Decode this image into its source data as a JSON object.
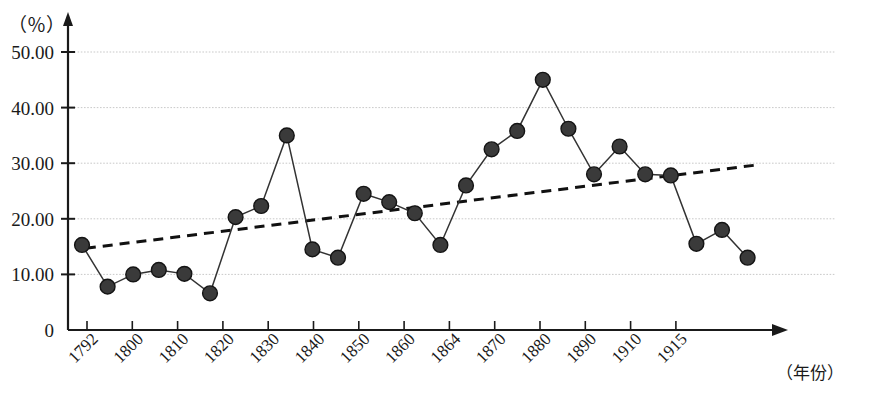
{
  "chart_data": {
    "type": "line",
    "title": "",
    "subtitle": "",
    "xlabel": "（年份）",
    "ylabel": "（％）",
    "y_unit_label": "（％）",
    "ylim": [
      0,
      55
    ],
    "xlim_index": [
      0,
      27
    ],
    "grid": true,
    "grid_style": "dotted-horizontal",
    "legend": "none",
    "y_ticks": [
      "0",
      "10.00",
      "20.00",
      "30.00",
      "40.00",
      "50.00"
    ],
    "y_tick_values": [
      0,
      10,
      20,
      30,
      40,
      50
    ],
    "x_tick_labels": [
      "1792",
      "1800",
      "1810",
      "1820",
      "1830",
      "1840",
      "1850",
      "1860",
      "1864",
      "1870",
      "1880",
      "1890",
      "1910",
      "1915"
    ],
    "x_tick_indices": [
      0,
      2,
      4,
      6,
      8,
      10,
      12,
      14,
      16,
      18,
      20,
      22,
      24,
      26
    ],
    "series": [
      {
        "name": "value",
        "style": "line-with-round-markers",
        "color": "#333333",
        "x_index": [
          0,
          1,
          2,
          3,
          4,
          5,
          6,
          7,
          8,
          9,
          10,
          11,
          12,
          13,
          14,
          15,
          16,
          17,
          18,
          19,
          20,
          21,
          22,
          23,
          24,
          25,
          26,
          27
        ],
        "values": [
          15.3,
          7.8,
          10.0,
          10.8,
          10.1,
          6.6,
          20.3,
          22.3,
          35.0,
          14.5,
          13.0,
          24.5,
          23.0,
          21.0,
          15.3,
          26.0,
          32.5,
          35.8,
          45.0,
          36.2,
          28.0,
          33.0,
          28.0,
          27.8,
          15.5,
          18.0,
          13.0
        ],
        "values_full": [
          15.3,
          7.8,
          10.0,
          10.8,
          10.1,
          6.6,
          20.3,
          22.3,
          35.0,
          14.5,
          13.0,
          24.5,
          23.0,
          21.0,
          15.3,
          26.0,
          32.5,
          35.8,
          45.0,
          36.2,
          28.0,
          33.0,
          28.0,
          27.8,
          15.5,
          18.0,
          13.0
        ]
      },
      {
        "name": "trend",
        "style": "dashed-line",
        "color": "#111111",
        "start_value": 14.7,
        "end_value": 29.7,
        "start_index": 0.15,
        "end_index": 26.4
      }
    ]
  }
}
